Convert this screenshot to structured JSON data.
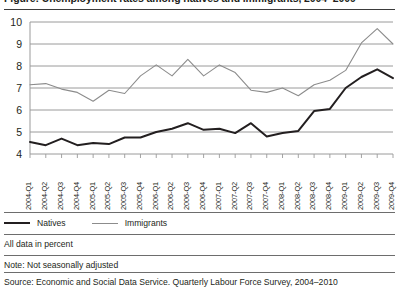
{
  "figure": {
    "title": "Figure: Unemployment rates among natives and immigrants, 2004–2009",
    "title_visible_clipped": true
  },
  "legend": {
    "position": "bottom-left",
    "entries": [
      {
        "label": "Natives",
        "color": "#231f20",
        "icon": "line-swatch-icon"
      },
      {
        "label": "Immigrants",
        "color": "#8c8c8c",
        "icon": "line-swatch-icon"
      }
    ]
  },
  "footnotes": {
    "units": "All data in percent",
    "note": "Note: Not seasonally adjusted",
    "source": "Source: Economic and Social Data Service. Quarterly Labour Force Survey, 2004–2010"
  },
  "chart_data": {
    "type": "line",
    "title": "",
    "xlabel": "",
    "ylabel": "",
    "ylim": [
      4,
      10
    ],
    "yticks": [
      4,
      5,
      6,
      7,
      8,
      9,
      10
    ],
    "grid": true,
    "legend_position": "bottom-left",
    "categories": [
      "2004-Q1",
      "2004-Q2",
      "2004-Q3",
      "2004-Q4",
      "2005-Q1",
      "2005-Q2",
      "2005-Q3",
      "2005-Q4",
      "2006-Q1",
      "2006-Q2",
      "2006-Q3",
      "2006-Q4",
      "2007-Q1",
      "2007-Q2",
      "2007-Q3",
      "2007-Q4",
      "2008-Q1",
      "2008-Q2",
      "2008-Q3",
      "2008-Q4",
      "2009-Q1",
      "2009-Q2",
      "2009-Q3",
      "2009-Q4"
    ],
    "series": [
      {
        "name": "Natives",
        "color": "#231f20",
        "width": 2.0,
        "values": [
          4.55,
          4.4,
          4.7,
          4.4,
          4.5,
          4.45,
          4.75,
          4.75,
          5.0,
          5.15,
          5.4,
          5.1,
          5.15,
          4.95,
          5.4,
          4.8,
          4.95,
          5.05,
          5.95,
          6.05,
          7.0,
          7.5,
          7.85,
          7.45
        ]
      },
      {
        "name": "Immigrants",
        "color": "#8c8c8c",
        "width": 1.1,
        "values": [
          7.15,
          7.2,
          6.95,
          6.8,
          6.4,
          6.9,
          6.75,
          7.55,
          8.05,
          7.55,
          8.3,
          7.55,
          8.05,
          7.7,
          6.9,
          6.8,
          7.0,
          6.65,
          7.15,
          7.35,
          7.8,
          9.05,
          9.7,
          9.0
        ]
      }
    ]
  }
}
